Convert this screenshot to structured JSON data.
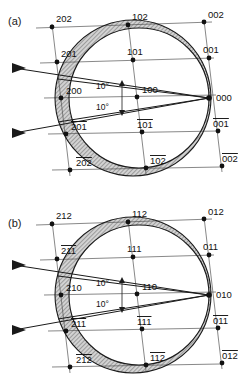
{
  "figure": {
    "background_color": "#ffffff",
    "line_color": "#1a1a1a",
    "shade_color": "#9a9a9a",
    "node_color": "#111111"
  },
  "panels": [
    {
      "tag": "(a)",
      "origin_label": "000",
      "angles": [
        {
          "text": "10°"
        },
        {
          "text": "10°"
        }
      ],
      "rows": [
        {
          "name": "row-top",
          "nodes": [
            {
              "label": "202",
              "overbar": false
            },
            {
              "label": "102",
              "overbar": false
            },
            {
              "label": "002",
              "overbar": false
            }
          ]
        },
        {
          "name": "row-upper",
          "nodes": [
            {
              "label": "201",
              "overbar": false
            },
            {
              "label": "101",
              "overbar": false
            },
            {
              "label": "001",
              "overbar": false
            }
          ]
        },
        {
          "name": "row-center",
          "nodes": [
            {
              "label": "200",
              "overbar": false
            },
            {
              "label": "100",
              "overbar": false
            },
            {
              "label": "000",
              "overbar": false
            }
          ]
        },
        {
          "name": "row-lower",
          "nodes": [
            {
              "label": "201",
              "overbar": true
            },
            {
              "label": "101",
              "overbar": true
            },
            {
              "label": "001",
              "overbar": true
            }
          ]
        },
        {
          "name": "row-bottom",
          "nodes": [
            {
              "label": "202",
              "overbar": true
            },
            {
              "label": "102",
              "overbar": true
            },
            {
              "label": "002",
              "overbar": true
            }
          ]
        }
      ]
    },
    {
      "tag": "(b)",
      "origin_label": "010",
      "angles": [
        {
          "text": "10°"
        },
        {
          "text": "10°"
        }
      ],
      "rows": [
        {
          "name": "row-top",
          "nodes": [
            {
              "label": "212",
              "overbar": false
            },
            {
              "label": "112",
              "overbar": false
            },
            {
              "label": "012",
              "overbar": false
            }
          ]
        },
        {
          "name": "row-upper",
          "nodes": [
            {
              "label": "211",
              "overbar": false
            },
            {
              "label": "111",
              "overbar": false
            },
            {
              "label": "011",
              "overbar": false
            }
          ]
        },
        {
          "name": "row-center",
          "nodes": [
            {
              "label": "210",
              "overbar": false
            },
            {
              "label": "110",
              "overbar": false
            },
            {
              "label": "010",
              "overbar": false
            }
          ]
        },
        {
          "name": "row-lower",
          "nodes": [
            {
              "label": "211",
              "overbar": true
            },
            {
              "label": "111",
              "overbar": true
            },
            {
              "label": "011",
              "overbar": true
            }
          ]
        },
        {
          "name": "row-bottom",
          "nodes": [
            {
              "label": "212",
              "overbar": true
            },
            {
              "label": "112",
              "overbar": true
            },
            {
              "label": "012",
              "overbar": true
            }
          ]
        }
      ]
    }
  ]
}
